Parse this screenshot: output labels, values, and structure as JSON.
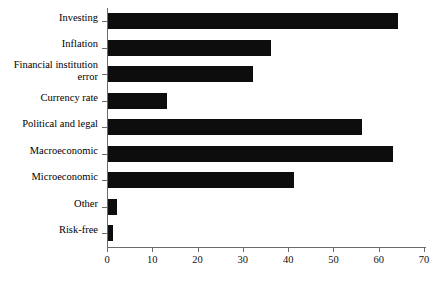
{
  "chart_data": {
    "type": "bar",
    "orientation": "horizontal",
    "title": "",
    "subtitle": "",
    "xlabel": "",
    "ylabel": "",
    "xlim": [
      0,
      70
    ],
    "xticks": [
      "0",
      "10",
      "20",
      "30",
      "40",
      "50",
      "60",
      "70"
    ],
    "grid": false,
    "legend": null,
    "legend_position": "none",
    "bar_color": "#0d0d0d",
    "axis_color": "#6b6b6b",
    "categories": [
      "Investing",
      "Inflation",
      "Financial institution error",
      "Currency rate",
      "Political and legal",
      "Macroeconomic",
      "Microeconomic",
      "Other",
      "Risk-free"
    ],
    "values": [
      64,
      36,
      32,
      13,
      56,
      63,
      41,
      2,
      1
    ]
  },
  "axis": {
    "x_tick_values": [
      0,
      10,
      20,
      30,
      40,
      50,
      60,
      70
    ]
  }
}
